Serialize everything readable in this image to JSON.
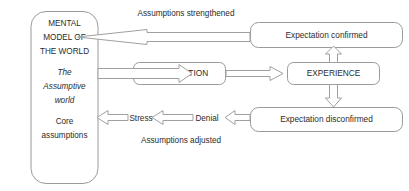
{
  "diagram": {
    "colors": {
      "stroke": "#9a9a9a",
      "arrow_stroke": "#a0a0a0",
      "text": "#2b2b2b",
      "background": "#ffffff"
    },
    "mental_model_box": {
      "lines": [
        {
          "text": "MENTAL",
          "style": "normal"
        },
        {
          "text": "MODEL OF",
          "style": "normal"
        },
        {
          "text": "THE WORLD",
          "style": "normal"
        },
        {
          "text": "The",
          "style": "italic"
        },
        {
          "text": "Assumptive",
          "style": "italic"
        },
        {
          "text": "world",
          "style": "italic"
        },
        {
          "text": "Core",
          "style": "normal"
        },
        {
          "text": "assumptions",
          "style": "normal"
        }
      ]
    },
    "boxes": [
      {
        "id": "expectation",
        "label": "EXPECTATION"
      },
      {
        "id": "experience",
        "label": "EXPERIENCE"
      },
      {
        "id": "expectation-confirmed",
        "label": "Expectation confirmed"
      },
      {
        "id": "expectation-disconfirmed",
        "label": "Expectation disconfirmed"
      }
    ],
    "edge_labels": [
      {
        "id": "assumptions-strengthened",
        "text": "Assumptions strengthened"
      },
      {
        "id": "stress",
        "text": "Stress"
      },
      {
        "id": "denial",
        "text": "Denial"
      },
      {
        "id": "assumptions-adjusted",
        "text": "Assumptions adjusted"
      }
    ]
  }
}
